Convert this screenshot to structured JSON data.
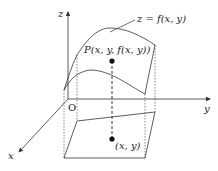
{
  "diagram": {
    "type": "3d-surface-projection",
    "labels": {
      "z_axis": "z",
      "y_axis": "y",
      "x_axis": "x",
      "origin": "O",
      "surface": "z = f(x, y)",
      "point_P": "P(x, y, f(x, y))",
      "point_xy": "(x, y)"
    },
    "colors": {
      "line": "#333333",
      "point": "#111111",
      "background": "#ffffff"
    }
  }
}
